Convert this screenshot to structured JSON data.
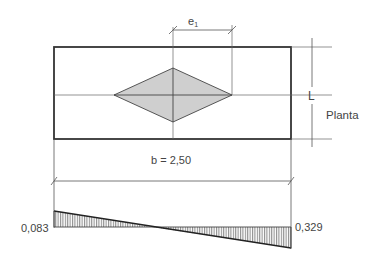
{
  "diagram": {
    "plan_label": "Planta",
    "eccentricity_label": "e",
    "eccentricity_subscript": "1",
    "length_label": "L",
    "width_label": "b = 2,50",
    "pressure_left": "0,083",
    "pressure_right": "0,329"
  },
  "colors": {
    "line": "#333333",
    "thin_line": "#555555",
    "diamond_fill": "#cfcfcf",
    "hatch": "#555555"
  }
}
